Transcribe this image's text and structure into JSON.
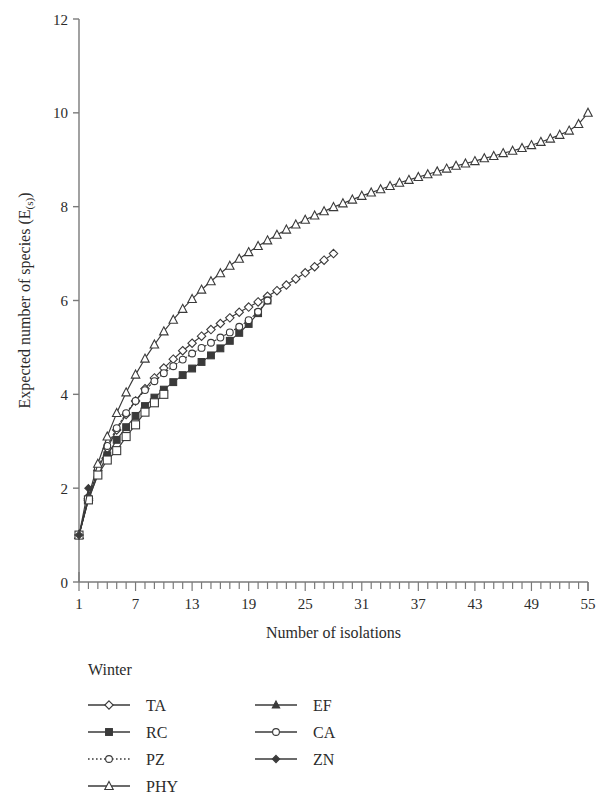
{
  "chart_data": {
    "type": "line",
    "title": "",
    "subtitle": "",
    "xlabel": "Number of isolations",
    "ylabel": "Expected number of species (E(s))",
    "ylabel_main": "Expected number of species (E",
    "ylabel_sub": "(s)",
    "ylabel_tail": ")",
    "xlim": [
      1,
      55
    ],
    "ylim": [
      0,
      12
    ],
    "x_ticks_major": [
      1,
      7,
      13,
      19,
      25,
      31,
      37,
      43,
      49,
      55
    ],
    "x_tick_minor_step": 1,
    "y_ticks_major": [
      0,
      2,
      4,
      6,
      8,
      10,
      12
    ],
    "grid": false,
    "legend_position": "below-plot-two-columns",
    "legend_title": "Winter",
    "series": [
      {
        "name": "TA",
        "marker": "open-diamond",
        "line": "solid",
        "x": [
          1,
          2,
          3,
          4,
          5,
          6,
          7,
          8,
          9,
          10,
          11,
          12,
          13,
          14,
          15,
          16,
          17,
          18,
          19,
          20,
          21,
          22,
          23,
          24,
          25,
          26,
          27,
          28
        ],
        "values": [
          1.0,
          1.78,
          2.38,
          2.85,
          3.24,
          3.57,
          3.86,
          4.12,
          4.35,
          4.56,
          4.75,
          4.93,
          5.09,
          5.24,
          5.38,
          5.51,
          5.63,
          5.75,
          5.86,
          5.97,
          6.09,
          6.21,
          6.33,
          6.46,
          6.59,
          6.72,
          6.86,
          7.0
        ]
      },
      {
        "name": "RC",
        "marker": "filled-square",
        "line": "solid",
        "x": [
          1,
          2,
          3,
          4,
          5,
          6,
          7,
          8,
          9,
          10,
          11,
          12,
          13,
          14,
          15,
          16,
          17,
          18,
          19,
          20,
          21
        ],
        "values": [
          1.0,
          1.75,
          2.3,
          2.7,
          3.03,
          3.3,
          3.54,
          3.75,
          3.93,
          4.1,
          4.26,
          4.41,
          4.55,
          4.69,
          4.83,
          4.98,
          5.14,
          5.31,
          5.5,
          5.73,
          6.0
        ]
      },
      {
        "name": "PZ",
        "marker": "open-circle",
        "line": "dotted",
        "x": [
          1,
          2,
          3,
          4,
          5,
          6,
          7,
          8,
          9,
          10,
          11,
          12,
          13,
          14,
          15,
          16,
          17,
          18,
          19,
          20,
          21
        ],
        "values": [
          1.0,
          1.8,
          2.42,
          2.9,
          3.28,
          3.6,
          3.86,
          4.09,
          4.28,
          4.45,
          4.6,
          4.74,
          4.87,
          4.99,
          5.1,
          5.21,
          5.32,
          5.44,
          5.58,
          5.76,
          6.0
        ]
      },
      {
        "name": "PHY",
        "marker": "open-triangle",
        "line": "solid",
        "x": [
          1,
          2,
          3,
          4,
          5,
          6,
          7,
          8,
          9,
          10,
          11,
          12,
          13,
          14,
          15,
          16,
          17,
          18,
          19,
          20,
          21,
          22,
          23,
          24,
          25,
          26,
          27,
          28,
          29,
          30,
          31,
          32,
          33,
          34,
          35,
          36,
          37,
          38,
          39,
          40,
          41,
          42,
          43,
          44,
          45,
          46,
          47,
          48,
          49,
          50,
          51,
          52,
          53,
          54,
          55
        ],
        "values": [
          1.0,
          1.82,
          2.52,
          3.1,
          3.6,
          4.04,
          4.42,
          4.76,
          5.06,
          5.34,
          5.59,
          5.82,
          6.03,
          6.23,
          6.41,
          6.58,
          6.74,
          6.89,
          7.03,
          7.16,
          7.28,
          7.4,
          7.51,
          7.62,
          7.72,
          7.81,
          7.9,
          7.99,
          8.07,
          8.15,
          8.23,
          8.3,
          8.37,
          8.44,
          8.51,
          8.57,
          8.63,
          8.69,
          8.75,
          8.81,
          8.87,
          8.92,
          8.97,
          9.03,
          9.08,
          9.14,
          9.19,
          9.25,
          9.31,
          9.38,
          9.45,
          9.53,
          9.62,
          9.76,
          10.0
        ]
      },
      {
        "name": "EF",
        "marker": "filled-triangle",
        "line": "solid",
        "x": [
          1,
          2
        ],
        "values": [
          1.0,
          1.8
        ]
      },
      {
        "name": "CA",
        "marker": "open-square",
        "line": "solid",
        "x": [
          1,
          2,
          3,
          4,
          5,
          6,
          7,
          8,
          9,
          10
        ],
        "values": [
          1.0,
          1.75,
          2.28,
          2.6,
          2.8,
          3.1,
          3.35,
          3.62,
          3.82,
          4.0
        ]
      },
      {
        "name": "ZN",
        "marker": "filled-diamond",
        "line": "solid",
        "x": [
          1,
          2
        ],
        "values": [
          1.0,
          2.0
        ]
      }
    ],
    "legend_entries": [
      {
        "label": "TA",
        "marker": "open-diamond",
        "line": "solid",
        "column": 0
      },
      {
        "label": "RC",
        "marker": "filled-square",
        "line": "solid",
        "column": 0
      },
      {
        "label": "PZ",
        "marker": "open-circle",
        "line": "dotted",
        "column": 0
      },
      {
        "label": "PHY",
        "marker": "open-triangle",
        "line": "solid",
        "column": 0
      },
      {
        "label": "EF",
        "marker": "filled-triangle",
        "line": "solid",
        "column": 1
      },
      {
        "label": "CA",
        "marker": "open-circle",
        "line": "solid",
        "column": 1
      },
      {
        "label": "ZN",
        "marker": "filled-diamond",
        "line": "solid",
        "column": 1
      }
    ],
    "colors": {
      "line": "#3a3a3a",
      "axis": "#7a7a7a",
      "text": "#2b2b2b",
      "background": "#ffffff"
    }
  },
  "geometry": {
    "plot_left": 79,
    "plot_right": 588,
    "plot_top": 19,
    "plot_bottom": 582
  }
}
